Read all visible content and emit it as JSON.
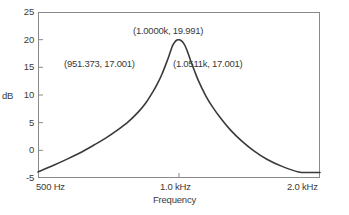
{
  "chart_data": {
    "type": "line",
    "title": "",
    "xlabel": "Frequency",
    "ylabel": "dB",
    "xscale": "log",
    "xlim": [
      500,
      2000
    ],
    "ylim": [
      -5,
      25
    ],
    "grid": false,
    "legend": null,
    "x_tick_labels": [
      "500 Hz",
      "1.0 kHz",
      "2.0 kHz"
    ],
    "x_tick_values": [
      500,
      1000,
      2000
    ],
    "y_tick_labels": [
      "25",
      "20",
      "15",
      "10",
      "5",
      "0",
      "-5"
    ],
    "y_tick_values": [
      25,
      20,
      15,
      10,
      5,
      0,
      -5
    ],
    "series": [
      {
        "name": "Response",
        "color": "#3a3a3a",
        "x": [
          500,
          540,
          580,
          620,
          660,
          700,
          740,
          780,
          820,
          850,
          880,
          900,
          920,
          940,
          951.373,
          960,
          970,
          980,
          990,
          1000,
          1010,
          1020,
          1030,
          1040,
          1051.1,
          1060,
          1080,
          1100,
          1140,
          1180,
          1230,
          1290,
          1360,
          1440,
          1540,
          1660,
          1800,
          1900,
          2000
        ],
        "y": [
          -3.9,
          -2.7,
          -1.5,
          -0.3,
          1.0,
          2.3,
          3.7,
          5.2,
          7.0,
          8.6,
          10.6,
          12.1,
          13.8,
          15.8,
          17.001,
          18.0,
          19.0,
          19.6,
          19.93,
          19.991,
          19.85,
          19.5,
          18.9,
          18.1,
          17.001,
          16.1,
          14.3,
          12.6,
          9.9,
          7.8,
          5.7,
          3.6,
          1.7,
          0.0,
          -1.6,
          -2.9,
          -3.9,
          -4.0,
          -4.0
        ]
      }
    ],
    "annotations": [
      {
        "id": "peak",
        "label": "(1.0000k, 19.991)",
        "x": 1000,
        "y": 19.991
      },
      {
        "id": "left",
        "label": "(951.373, 17.001)",
        "x": 951.373,
        "y": 17.001
      },
      {
        "id": "right",
        "label": "(1.0511k, 17.001)",
        "x": 1051.1,
        "y": 17.001
      }
    ]
  },
  "axes": {
    "y_label": "dB",
    "x_label": "Frequency",
    "y_ticks": [
      {
        "label": "25"
      },
      {
        "label": "20"
      },
      {
        "label": "15"
      },
      {
        "label": "10"
      },
      {
        "label": "5"
      },
      {
        "label": "0"
      },
      {
        "label": "-5"
      }
    ],
    "x_ticks": [
      {
        "label": "500 Hz"
      },
      {
        "label": "1.0 kHz"
      },
      {
        "label": "2.0 kHz"
      }
    ]
  },
  "annotations": {
    "peak": "(1.0000k, 19.991)",
    "left": "(951.373, 17.001)",
    "right": "(1.0511k, 17.001)"
  },
  "colors": {
    "curve": "#3a3a3a",
    "frame": "#8a8a8a",
    "text": "#3a3a3a",
    "background": "#ffffff"
  }
}
